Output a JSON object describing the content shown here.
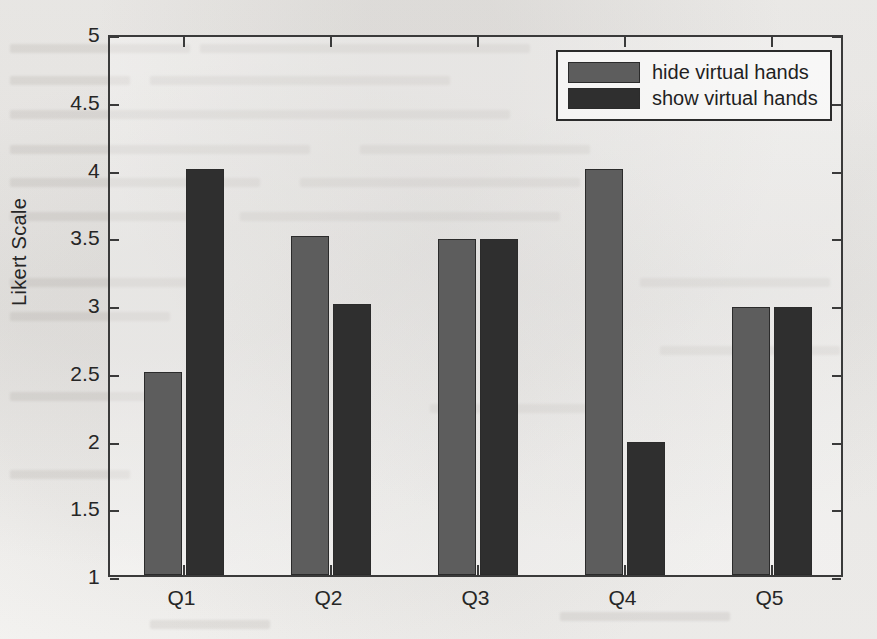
{
  "chart_data": {
    "type": "bar",
    "title": "",
    "xlabel": "",
    "ylabel": "Likert Scale",
    "categories": [
      "Q1",
      "Q2",
      "Q3",
      "Q4",
      "Q5"
    ],
    "series": [
      {
        "name": "hide virtual hands",
        "color": "#5d5d5d",
        "values": [
          2.5,
          3.5,
          3.48,
          4.0,
          2.98
        ]
      },
      {
        "name": "show virtual hands",
        "color": "#2f2f2f",
        "values": [
          4.0,
          3.0,
          3.48,
          1.98,
          2.98
        ]
      }
    ],
    "ylim": [
      1,
      5
    ],
    "ytick_labels": [
      "1",
      "1.5",
      "2",
      "2.5",
      "3",
      "3.5",
      "4",
      "4.5",
      "5"
    ],
    "ytick_values": [
      1,
      1.5,
      2,
      2.5,
      3,
      3.5,
      4,
      4.5,
      5
    ],
    "grid": false,
    "legend_position": "top-right",
    "legend": [
      "hide virtual hands",
      "show virtual hands"
    ]
  },
  "legend": {
    "entries": [
      {
        "label": "hide virtual hands",
        "swatch": "hide"
      },
      {
        "label": "show virtual hands",
        "swatch": "show"
      }
    ]
  },
  "axes": {
    "ylabel": "Likert Scale"
  }
}
